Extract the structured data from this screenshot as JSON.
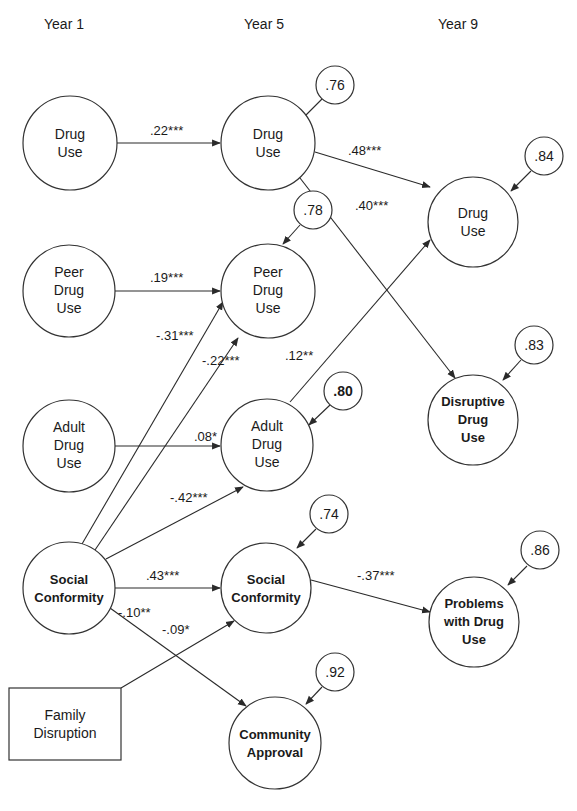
{
  "headers": {
    "year1": "Year 1",
    "year5": "Year 5",
    "year9": "Year 9"
  },
  "nodes": {
    "y1_drug_use": {
      "lines": [
        "Drug",
        "Use"
      ]
    },
    "y1_peer_drug_use": {
      "lines": [
        "Peer",
        "Drug",
        "Use"
      ]
    },
    "y1_adult_drug_use": {
      "lines": [
        "Adult",
        "Drug",
        "Use"
      ]
    },
    "y1_social_conformity": {
      "lines": [
        "Social",
        "Conformity"
      ]
    },
    "family_disruption": {
      "lines": [
        "Family",
        "Disruption"
      ]
    },
    "y5_drug_use": {
      "lines": [
        "Drug",
        "Use"
      ]
    },
    "y5_peer_drug_use": {
      "lines": [
        "Peer",
        "Drug",
        "Use"
      ]
    },
    "y5_adult_drug_use": {
      "lines": [
        "Adult",
        "Drug",
        "Use"
      ]
    },
    "y5_social_conformity": {
      "lines": [
        "Social",
        "Conformity"
      ]
    },
    "y5_community_approval": {
      "lines": [
        "Community",
        "Approval"
      ]
    },
    "y9_drug_use": {
      "lines": [
        "Drug",
        "Use"
      ]
    },
    "y9_disruptive_drug_use": {
      "lines": [
        "Disruptive",
        "Drug",
        "Use"
      ]
    },
    "y9_problems_with_drug_use": {
      "lines": [
        "Problems",
        "with Drug",
        "Use"
      ]
    }
  },
  "errors": {
    "y5_drug_use": ".76",
    "y5_peer_drug_use": ".78",
    "y5_adult_drug_use": ".80",
    "y5_social_conformity": ".74",
    "y5_community_approval": ".92",
    "y9_drug_use": ".84",
    "y9_disruptive_drug_use": ".83",
    "y9_problems_with_drug_use": ".86"
  },
  "paths": {
    "y1drug_to_y5drug": ".22***",
    "y1peer_to_y5peer": ".19***",
    "y1adult_to_y5adult": ".08*",
    "y1sc_to_y5peer": "-.31***",
    "y1sc_to_y5adult_a": "-.22***",
    "y1sc_to_y5adult_b": "-.42***",
    "y1sc_to_y5sc": ".43***",
    "y1sc_to_community": "-.10**",
    "family_to_y5sc": "-.09*",
    "y5drug_to_y9drug": ".48***",
    "y5drug_to_y9disruptive": ".40***",
    "y5adult_to_y9drug": ".12**",
    "y5sc_to_y9problems": "-.37***"
  }
}
